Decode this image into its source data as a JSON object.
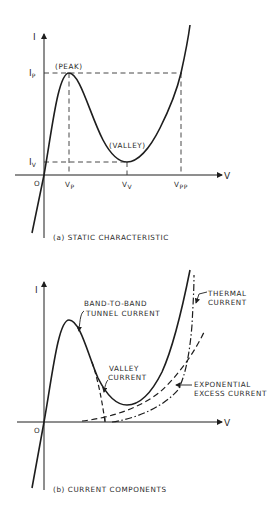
{
  "diagram_a": {
    "axis_y_label": "I",
    "axis_x_label": "V",
    "origin_label": "O",
    "peak_label": "(PEAK)",
    "valley_label": "(VALLEY)",
    "ip_main": "I",
    "ip_sub": "P",
    "iv_main": "I",
    "iv_sub": "V",
    "vp_main": "V",
    "vp_sub": "P",
    "vv_main": "V",
    "vv_sub": "V",
    "vpp_main": "V",
    "vpp_sub": "PP",
    "caption": "(a) STATIC CHARACTERISTIC"
  },
  "diagram_b": {
    "axis_y_label": "I",
    "axis_x_label": "V",
    "origin_label": "O",
    "tunnel_label_1": "BAND-TO-BAND",
    "tunnel_label_2": "TUNNEL CURRENT",
    "valley_label_1": "VALLEY",
    "valley_label_2": "CURRENT",
    "thermal_label_1": "THERMAL",
    "thermal_label_2": "CURRENT",
    "excess_label_1": "EXPONENTIAL",
    "excess_label_2": "EXCESS CURRENT",
    "caption": "(b) CURRENT COMPONENTS"
  },
  "colors": {
    "ink": "#1e1e1e",
    "background": "#ffffff"
  }
}
